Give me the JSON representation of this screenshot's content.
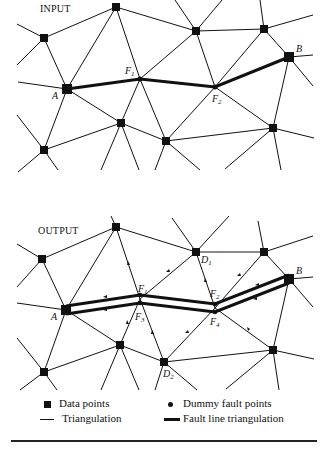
{
  "panels": {
    "input": {
      "title": "INPUT",
      "labels": {
        "A": "A",
        "B": "B",
        "F1": "F",
        "F1_sub": "1",
        "F2": "F",
        "F2_sub": "2"
      }
    },
    "output": {
      "title": "OUTPUT",
      "labels": {
        "A": "A",
        "B": "B",
        "F1": "F",
        "F1_sub": "1",
        "F2": "F",
        "F2_sub": "2",
        "F3": "F",
        "F3_sub": "3",
        "F4": "F",
        "F4_sub": "4",
        "D1": "D",
        "D1_sub": "1",
        "D2": "D",
        "D2_sub": "2"
      }
    }
  },
  "legend": {
    "data_points": "Data points",
    "dummy_fault_points": "Dummy fault points",
    "triangulation": "Triangulation",
    "fault_line_triangulation": "Fault line triangulation"
  },
  "icons": {
    "data_point": "filled-square",
    "dummy_fault_point": "filled-circle",
    "triangulation": "thin-line",
    "fault_line": "thick-line"
  },
  "colors": {
    "ink": "#111111",
    "background": "#ffffff"
  }
}
